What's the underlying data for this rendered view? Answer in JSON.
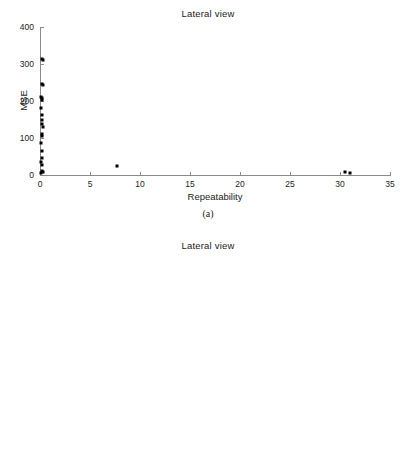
{
  "figure": {
    "panels": [
      {
        "caption": "(a)",
        "title": "Lateral view",
        "chart_ref": 0
      },
      {
        "caption": "(b)",
        "title": "Lateral view",
        "chart_ref": 1
      }
    ]
  },
  "chart_data": [
    {
      "type": "scatter",
      "title": "Lateral view",
      "xlabel": "Repeatability",
      "ylabel": "MSE",
      "xlim": [
        0,
        35
      ],
      "ylim": [
        0,
        400
      ],
      "xticks": [
        0,
        5,
        10,
        15,
        20,
        25,
        30,
        35
      ],
      "xticklabels": [
        "0",
        "5",
        "10",
        "15",
        "20",
        "25",
        "30",
        "35"
      ],
      "yticks": [
        0,
        100,
        200,
        300,
        400
      ],
      "yticklabels": [
        "0",
        "100",
        "200",
        "300",
        "400"
      ],
      "grid": false,
      "legend": null,
      "marker": "square",
      "marker_color": "#000000",
      "points": [
        {
          "x": 0.2,
          "y": 313
        },
        {
          "x": 0.33,
          "y": 311
        },
        {
          "x": 0.15,
          "y": 247
        },
        {
          "x": 0.28,
          "y": 242
        },
        {
          "x": 0.12,
          "y": 212
        },
        {
          "x": 0.22,
          "y": 208
        },
        {
          "x": 0.16,
          "y": 203
        },
        {
          "x": 0.14,
          "y": 180
        },
        {
          "x": 0.18,
          "y": 163
        },
        {
          "x": 0.2,
          "y": 150
        },
        {
          "x": 0.17,
          "y": 137
        },
        {
          "x": 0.3,
          "y": 130
        },
        {
          "x": 0.19,
          "y": 110
        },
        {
          "x": 0.15,
          "y": 105
        },
        {
          "x": 0.13,
          "y": 87
        },
        {
          "x": 0.24,
          "y": 65
        },
        {
          "x": 0.16,
          "y": 47
        },
        {
          "x": 0.14,
          "y": 36
        },
        {
          "x": 0.18,
          "y": 26
        },
        {
          "x": 0.2,
          "y": 11
        },
        {
          "x": 0.3,
          "y": 9
        },
        {
          "x": 0.12,
          "y": 5
        },
        {
          "x": 7.7,
          "y": 25
        },
        {
          "x": 30.45,
          "y": 8
        },
        {
          "x": 31.0,
          "y": 6
        }
      ]
    },
    {
      "type": "scatter",
      "title": "Lateral view",
      "xlabel": "Point Dispersion",
      "ylabel": "MSE",
      "xlim": [
        1,
        2.8
      ],
      "ylim": [
        0,
        350
      ],
      "xticks": [
        1,
        1.2,
        1.4,
        1.6,
        1.8,
        2,
        2.2,
        2.4,
        2.6,
        2.8
      ],
      "xticklabels": [
        "1",
        "1.2",
        "1.4",
        "1.6",
        "1.8",
        "2",
        "2.2",
        "2.4",
        "2.6",
        "2.8"
      ],
      "yticks": [
        0,
        50,
        100,
        150,
        200,
        250,
        300,
        350
      ],
      "yticklabels": [
        "0",
        "50",
        "100",
        "150",
        "200",
        "250",
        "300",
        "350"
      ],
      "grid": false,
      "legend": null,
      "marker": "square",
      "marker_color": "#000000",
      "points": [
        {
          "x": 1.168,
          "y": 313
        },
        {
          "x": 1.178,
          "y": 311
        },
        {
          "x": 1.147,
          "y": 247
        },
        {
          "x": 1.2,
          "y": 242
        },
        {
          "x": 1.158,
          "y": 212
        },
        {
          "x": 1.16,
          "y": 208
        },
        {
          "x": 1.182,
          "y": 203
        },
        {
          "x": 1.178,
          "y": 180
        },
        {
          "x": 1.196,
          "y": 163
        },
        {
          "x": 1.2,
          "y": 150
        },
        {
          "x": 1.198,
          "y": 137
        },
        {
          "x": 1.308,
          "y": 130
        },
        {
          "x": 1.202,
          "y": 110
        },
        {
          "x": 1.204,
          "y": 105
        },
        {
          "x": 1.185,
          "y": 87
        },
        {
          "x": 1.258,
          "y": 65
        },
        {
          "x": 1.93,
          "y": 26
        },
        {
          "x": 2.372,
          "y": 36
        },
        {
          "x": 2.57,
          "y": 11
        },
        {
          "x": 2.65,
          "y": 47
        },
        {
          "x": 2.658,
          "y": 9
        }
      ]
    }
  ]
}
